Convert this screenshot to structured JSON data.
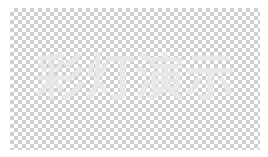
{
  "image": {
    "title_text": "彩灯演示",
    "background": "transparency-checkerboard",
    "colors": {
      "text": "#e8e8e8",
      "checker_light": "#ffffff",
      "checker_dark": "#cfcfcf"
    }
  }
}
